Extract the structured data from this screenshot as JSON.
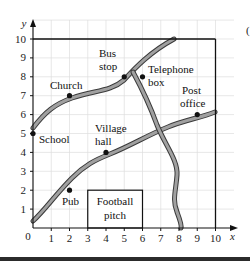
{
  "diagram": {
    "type": "coordinate-grid-map",
    "axes": {
      "x_label": "x",
      "y_label": "y",
      "origin_label": "0",
      "x_ticks": [
        "1",
        "2",
        "3",
        "4",
        "5",
        "6",
        "7",
        "8",
        "9",
        "10"
      ],
      "y_ticks": [
        "1",
        "2",
        "3",
        "4",
        "5",
        "6",
        "7",
        "8",
        "9",
        "10"
      ],
      "x_range": [
        0,
        10
      ],
      "y_range": [
        0,
        10
      ]
    },
    "locations": [
      {
        "name": "Church",
        "x": 2,
        "y": 7
      },
      {
        "name_line1": "Bus",
        "name_line2": "stop",
        "x": 5,
        "y": 8
      },
      {
        "name_line1": "Telephone",
        "name_line2": "box",
        "x": 6,
        "y": 8
      },
      {
        "name_line1": "Post",
        "name_line2": "office",
        "x": 9,
        "y": 6
      },
      {
        "name": "School",
        "x": 0,
        "y": 5
      },
      {
        "name_line1": "Village",
        "name_line2": "hall",
        "x": 4,
        "y": 4
      },
      {
        "name": "Pub",
        "x": 2,
        "y": 2
      }
    ],
    "football_pitch": {
      "line1": "Football",
      "line2": "pitch",
      "x_from": 3,
      "x_to": 6,
      "y_from": 0,
      "y_to": 2
    },
    "colors": {
      "road_fill": "#9a9a9a",
      "road_edge": "#3a3a3a",
      "grid": "#dcdcdc",
      "boundary": "#111111"
    }
  }
}
